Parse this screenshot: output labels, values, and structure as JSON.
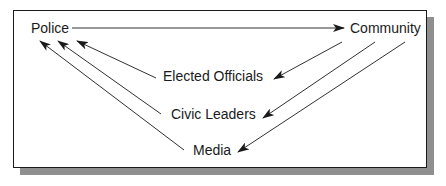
{
  "diagram": {
    "type": "communication-flow",
    "nodes": {
      "police": "Police",
      "community": "Community",
      "elected_officials": "Elected Officials",
      "civic_leaders": "Civic Leaders",
      "media": "Media"
    },
    "edges": [
      {
        "from": "Police",
        "to": "Community"
      },
      {
        "from": "Elected Officials",
        "to": "Police"
      },
      {
        "from": "Civic Leaders",
        "to": "Police"
      },
      {
        "from": "Media",
        "to": "Police"
      },
      {
        "from": "Community",
        "to": "Elected Officials"
      },
      {
        "from": "Community",
        "to": "Civic Leaders"
      },
      {
        "from": "Community",
        "to": "Media"
      }
    ],
    "colors": {
      "line": "#1a1a1a",
      "shadow": "#8f8f8f",
      "background": "#ffffff"
    }
  }
}
